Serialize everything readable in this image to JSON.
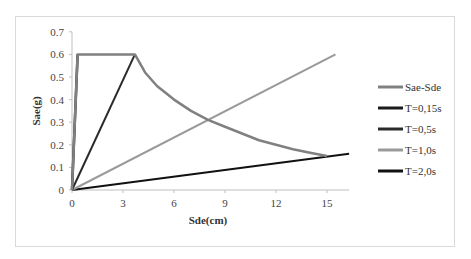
{
  "chart_data": {
    "type": "line",
    "title": "",
    "xlabel": "Sde(cm)",
    "ylabel": "Sae(g)",
    "xlim": [
      0,
      16.3
    ],
    "ylim": [
      0,
      0.7
    ],
    "x_ticks": [
      "0",
      "3",
      "6",
      "9",
      "12",
      "15"
    ],
    "y_ticks": [
      "0",
      "0.1",
      "0.2",
      "0.3",
      "0.4",
      "0.5",
      "0.6",
      "0.7"
    ],
    "grid": false,
    "legend_position": "right",
    "series": [
      {
        "name": "Sae-Sde",
        "color": "#808080",
        "width": 2.5,
        "x": [
          0,
          0.33,
          3.7,
          4.3,
          5.0,
          6.0,
          7.0,
          8.0,
          9.0,
          10.0,
          11.0,
          12.0,
          13.0,
          14.0,
          15.0
        ],
        "y": [
          0,
          0.6,
          0.6,
          0.52,
          0.46,
          0.4,
          0.35,
          0.31,
          0.28,
          0.25,
          0.22,
          0.2,
          0.18,
          0.165,
          0.15
        ]
      },
      {
        "name": "T=0,15s",
        "color": "#1a1a1a",
        "width": 2.5,
        "x": [
          0,
          0.33
        ],
        "y": [
          0,
          0.6
        ]
      },
      {
        "name": "T=0,5s",
        "color": "#2a2a2a",
        "width": 2,
        "x": [
          0,
          3.7
        ],
        "y": [
          0,
          0.6
        ]
      },
      {
        "name": "T=1,0s",
        "color": "#9a9a9a",
        "width": 2,
        "x": [
          0,
          15.5
        ],
        "y": [
          0,
          0.6
        ]
      },
      {
        "name": "T=2,0s",
        "color": "#111111",
        "width": 2,
        "x": [
          0,
          16.3
        ],
        "y": [
          0,
          0.16
        ]
      }
    ]
  }
}
